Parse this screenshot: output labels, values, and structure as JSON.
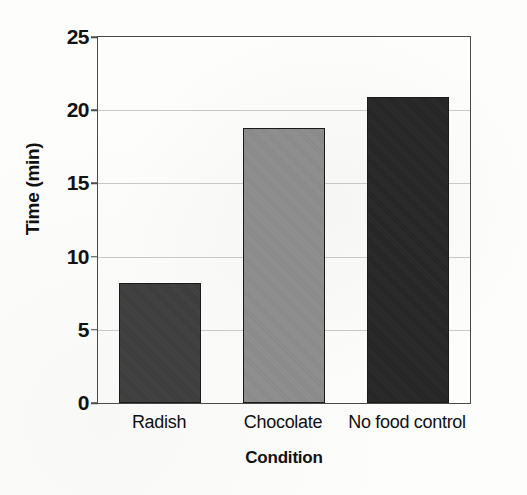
{
  "chart_data": {
    "type": "bar",
    "title": "",
    "xlabel": "Condition",
    "ylabel": "Time (min)",
    "categories": [
      "Radish",
      "Chocolate",
      "No food control"
    ],
    "values": [
      8.2,
      18.8,
      20.9
    ],
    "series": [
      {
        "name": "Time (min)",
        "values": [
          8.2,
          18.8,
          20.9
        ]
      }
    ],
    "ylim": [
      0,
      25
    ],
    "yticks": [
      0,
      5,
      10,
      15,
      20,
      25
    ],
    "ytick_labels": [
      "0",
      "5",
      "10",
      "15",
      "20",
      "25"
    ],
    "grid": true,
    "legend": "none",
    "bar_colors": [
      "#3d3d3d",
      "#8d8d8d",
      "#252525"
    ],
    "bar_edge_color": "#1b1b1b",
    "grid_color": "#c9c9c9",
    "axis_color": "#4a4a4a",
    "background": "#fdfdfc"
  },
  "axes": {
    "y_title": "Time (min)",
    "x_title": "Condition"
  },
  "bars": [
    {
      "label": "Radish",
      "value": 8.2,
      "color": "#3d3d3d"
    },
    {
      "label": "Chocolate",
      "value": 18.8,
      "color": "#8d8d8d"
    },
    {
      "label": "No food control",
      "value": 20.9,
      "color": "#252525"
    }
  ]
}
